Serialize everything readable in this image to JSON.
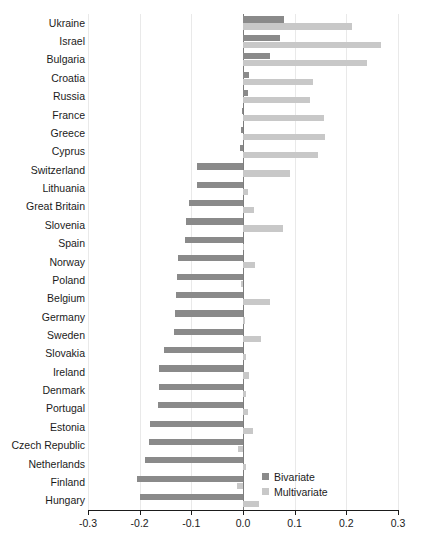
{
  "chart_data": {
    "type": "bar",
    "orientation": "horizontal",
    "title": "",
    "xlabel": "",
    "ylabel": "",
    "xlim": [
      -0.3,
      0.3
    ],
    "xticks": [
      -0.3,
      -0.2,
      -0.1,
      0.0,
      0.1,
      0.2,
      0.3
    ],
    "xtick_labels": [
      "-0.3",
      "-0.2",
      "-0.1",
      "0.0",
      "0.1",
      "0.2",
      "0.3"
    ],
    "grid": true,
    "legend_position": "bottom-right",
    "categories": [
      "Ukraine",
      "Israel",
      "Bulgaria",
      "Croatia",
      "Russia",
      "France",
      "Greece",
      "Cyprus",
      "Switzerland",
      "Lithuania",
      "Great Britain",
      "Slovenia",
      "Spain",
      "Norway",
      "Poland",
      "Belgium",
      "Germany",
      "Sweden",
      "Slovakia",
      "Ireland",
      "Denmark",
      "Portugal",
      "Estonia",
      "Czech Republic",
      "Netherlands",
      "Finland",
      "Hungary"
    ],
    "series": [
      {
        "name": "Bivariate",
        "color": "#8a8a8a",
        "values": [
          0.079,
          0.071,
          0.052,
          0.012,
          0.009,
          -0.002,
          -0.004,
          -0.006,
          -0.09,
          -0.089,
          -0.105,
          -0.11,
          -0.113,
          -0.125,
          -0.127,
          -0.13,
          -0.131,
          -0.134,
          -0.152,
          -0.162,
          -0.162,
          -0.165,
          -0.18,
          -0.182,
          -0.189,
          -0.205,
          -0.2
        ]
      },
      {
        "name": "Multivariate",
        "color": "#c8c8c8",
        "values": [
          0.211,
          0.268,
          0.24,
          0.135,
          0.13,
          0.157,
          0.159,
          0.146,
          0.091,
          0.009,
          0.022,
          0.078,
          0.002,
          0.023,
          -0.004,
          0.052,
          0.003,
          0.035,
          0.006,
          0.011,
          0.005,
          0.009,
          0.019,
          -0.009,
          0.006,
          -0.012,
          0.03
        ]
      }
    ]
  },
  "legend": {
    "items": [
      {
        "label": "Bivariate",
        "color": "#8a8a8a"
      },
      {
        "label": "Multivariate",
        "color": "#c8c8c8"
      }
    ]
  }
}
